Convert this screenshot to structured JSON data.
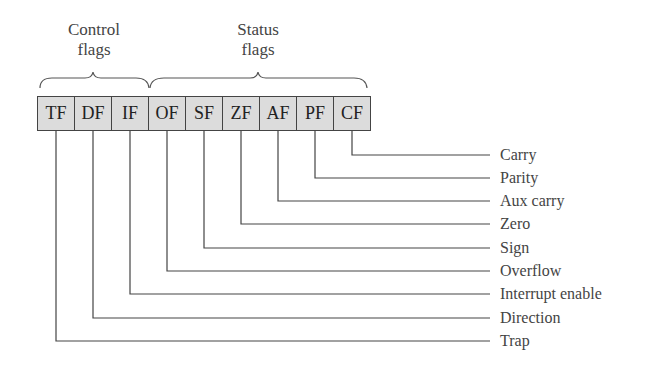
{
  "groups": {
    "control": {
      "line1": "Control",
      "line2": "flags"
    },
    "status": {
      "line1": "Status",
      "line2": "flags"
    }
  },
  "flags": [
    {
      "abbr": "TF",
      "name": "Trap",
      "group": "control"
    },
    {
      "abbr": "DF",
      "name": "Direction",
      "group": "control"
    },
    {
      "abbr": "IF",
      "name": "Interrupt enable",
      "group": "control"
    },
    {
      "abbr": "OF",
      "name": "Overflow",
      "group": "status"
    },
    {
      "abbr": "SF",
      "name": "Sign",
      "group": "status"
    },
    {
      "abbr": "ZF",
      "name": "Zero",
      "group": "status"
    },
    {
      "abbr": "AF",
      "name": "Aux carry",
      "group": "status"
    },
    {
      "abbr": "PF",
      "name": "Parity",
      "group": "status"
    },
    {
      "abbr": "CF",
      "name": "Carry",
      "group": "status"
    }
  ],
  "colors": {
    "cell_fill": "#dcdcdc",
    "line": "#444444"
  }
}
